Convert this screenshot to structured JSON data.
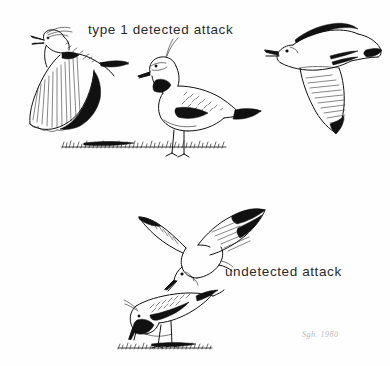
{
  "figure": {
    "background_color": "#fefefe",
    "ink_color": "#111111",
    "width": 390,
    "height": 366
  },
  "captions": {
    "top": "type 1 detected attack",
    "bottom": "undetected attack"
  },
  "signature": {
    "text": "Sgh. 1980"
  },
  "panels": [
    {
      "id": "top-panel",
      "label": "type 1 detected attack",
      "subjects": [
        {
          "name": "lapwing-flying-calling",
          "species": "lapwing",
          "pose": "wings-down-calling",
          "position": "left"
        },
        {
          "name": "lapwing-standing-alert",
          "species": "lapwing",
          "pose": "standing-crest-raised",
          "position": "center"
        },
        {
          "name": "gull-flying-approach",
          "species": "gull",
          "pose": "gliding-left",
          "position": "right"
        }
      ],
      "ground": "grass-line"
    },
    {
      "id": "bottom-panel",
      "label": "undetected attack",
      "subjects": [
        {
          "name": "gull-diving-attack",
          "species": "gull",
          "pose": "wings-raised-descending",
          "position": "center"
        },
        {
          "name": "lapwing-feeding-head-down",
          "species": "lapwing",
          "pose": "bent-over-feeding",
          "position": "center-lower"
        }
      ],
      "ground": "grass-line"
    }
  ]
}
